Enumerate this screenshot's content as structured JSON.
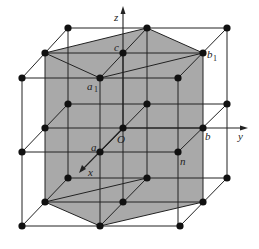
{
  "figure": {
    "type": "crystal-lattice-3x3x3",
    "colors": {
      "background": "#ffffff",
      "shade": "#a9a9a9",
      "line": "#222222",
      "node": "#111111"
    }
  },
  "axes": {
    "x": {
      "label": "x"
    },
    "y": {
      "label": "y"
    },
    "z": {
      "label": "z"
    },
    "origin": {
      "label": "O"
    }
  },
  "labels": {
    "a": "a",
    "b": "b",
    "c": "c",
    "n": "n",
    "a1": "a",
    "a1_sub": "1",
    "b1": "b",
    "b1_sub": "1"
  }
}
